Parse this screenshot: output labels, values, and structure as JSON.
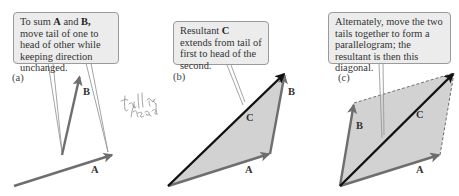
{
  "figure": {
    "colors": {
      "background": "#ffffff",
      "callout_fill": "#ececec",
      "callout_border": "#9a9a9a",
      "vector_gray": "#6e6e6e",
      "resultant": "#111111",
      "fill": "#d2d2d2",
      "handwriting": "#9a9a9a"
    },
    "panels": [
      {
        "id": "a",
        "label": "(a)",
        "callout": {
          "pre": "To sum ",
          "v1": "A",
          "mid": " and ",
          "v2": "B,",
          "post": " move tail of one to head of other while keeping direction unchanged."
        },
        "vectors": [
          {
            "name": "A",
            "from": [
              14,
              186
            ],
            "to": [
              113,
              155
            ]
          },
          {
            "name": "B",
            "from": [
              62,
              155
            ],
            "to": [
              80,
              75
            ]
          }
        ],
        "labels": {
          "A": "A",
          "B": "B"
        }
      },
      {
        "id": "b",
        "label": "(b)",
        "callout": {
          "pre": "Resultant ",
          "v1": "C",
          "post": " extends from tail of first to head of the second."
        },
        "vectors": [
          {
            "name": "A",
            "from": [
              168,
              186
            ],
            "to": [
              270,
              154
            ]
          },
          {
            "name": "B",
            "from": [
              270,
              154
            ],
            "to": [
              285,
              73
            ]
          },
          {
            "name": "C",
            "from": [
              168,
              186
            ],
            "to": [
              285,
              73
            ]
          }
        ],
        "labels": {
          "A": "A",
          "B": "B",
          "C": "C"
        }
      },
      {
        "id": "c",
        "label": "(c)",
        "callout": {
          "text": "Alternately, move the two tails together to form a parallelogram; the resultant is then this diagonal."
        },
        "vectors": [
          {
            "name": "A",
            "from": [
              340,
              186
            ],
            "to": [
              440,
              155
            ]
          },
          {
            "name": "B",
            "from": [
              340,
              186
            ],
            "to": [
              354,
              103
            ]
          },
          {
            "name": "C",
            "from": [
              340,
              186
            ],
            "to": [
              454,
              73
            ]
          }
        ],
        "labels": {
          "A": "A",
          "B": "B",
          "C": "C"
        }
      }
    ],
    "handwritten_note": "tail on head"
  }
}
